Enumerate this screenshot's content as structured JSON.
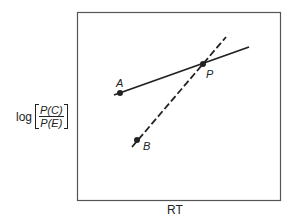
{
  "diagram": {
    "x_axis_label": "RT",
    "y_axis_label": {
      "prefix": "log",
      "numerator": "P(C)",
      "denominator": "P(E)"
    },
    "points": [
      {
        "label": "A",
        "x": 120,
        "y": 93
      },
      {
        "label": "B",
        "x": 137,
        "y": 140
      },
      {
        "label": "P",
        "x": 203,
        "y": 64
      }
    ],
    "lines": [
      {
        "name": "solid-line-A",
        "style": "solid",
        "from": [
          114,
          95
        ],
        "to": [
          249,
          47
        ]
      },
      {
        "name": "dashed-line-B",
        "style": "dashed",
        "from": [
          132,
          147
        ],
        "to": [
          226,
          37
        ]
      }
    ],
    "colors": {
      "ink": "#222222",
      "frame": "#555555",
      "background": "#ffffff"
    }
  }
}
